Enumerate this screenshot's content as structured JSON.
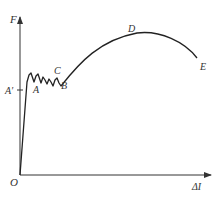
{
  "diagram": {
    "type": "stress-strain curve (force vs. elongation)",
    "axes": {
      "y_label": "F",
      "x_label": "ΔI",
      "origin_label": "O"
    },
    "points": {
      "A_prime": "A′",
      "A": "A",
      "B": "B",
      "C": "C",
      "D": "D",
      "E": "E"
    },
    "colors": {
      "curve": "#222222",
      "axis": "#333333",
      "label": "#333333"
    }
  }
}
